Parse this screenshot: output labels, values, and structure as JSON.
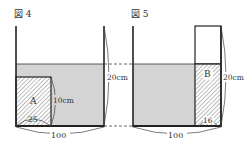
{
  "figures": [
    {
      "title": "図 4",
      "block_label": "A",
      "block_height_label": "10cm",
      "block_width_label": "25",
      "container_height_label": "20cm",
      "container_width_label": "100"
    },
    {
      "title": "図 5",
      "block_label": "B",
      "block_width_label": "16",
      "container_height_label": "20cm",
      "container_width_label": "100"
    }
  ],
  "colors": {
    "water": "#d4d4d4",
    "line": "#222222",
    "hatch": "#666666"
  }
}
